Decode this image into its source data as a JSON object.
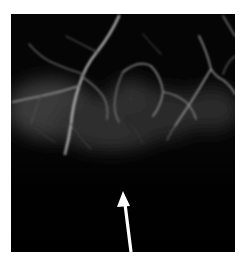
{
  "image": {
    "kind": "angiogram",
    "background_color": "#ffffff",
    "frame_color": "#050505",
    "vessel_color": "#9a9a9a",
    "haze_color": "#3a3a3a",
    "arrow_color": "#ffffff",
    "annotation": {
      "type": "arrow",
      "direction": "up",
      "tip": [
        123,
        192
      ],
      "tail": [
        131,
        252
      ]
    }
  }
}
